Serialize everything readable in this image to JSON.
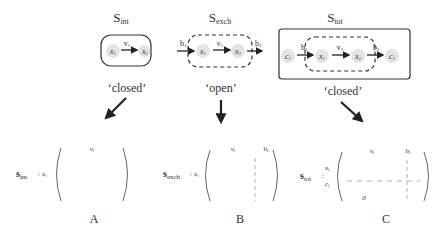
{
  "panels": [
    {
      "id": "A",
      "system_label": "S",
      "system_sub": "int",
      "boundary": "closed",
      "boundary_label": "‘closed’",
      "nodes": [
        "x",
        "x"
      ],
      "node_subs": [
        "1",
        "2"
      ],
      "reaction_label": "v",
      "reaction_sub": "1",
      "matrix_label": "s",
      "matrix_sub": "int",
      "row_labels": [
        "x_i"
      ],
      "col_labels": [
        "v_i"
      ],
      "panel_letter": "A"
    },
    {
      "id": "B",
      "system_label": "S",
      "system_sub": "exch",
      "boundary": "open",
      "boundary_label": "‘open’",
      "exchange_in": "b",
      "exchange_in_sub": "1",
      "exchange_out": "b",
      "exchange_out_sub": "2",
      "nodes": [
        "x",
        "x"
      ],
      "node_subs": [
        "1",
        "2"
      ],
      "reaction_label": "v",
      "reaction_sub": "1",
      "matrix_label": "s",
      "matrix_sub": "exch",
      "row_labels": [
        "x_i"
      ],
      "col_labels": [
        "v_i",
        "b_i"
      ],
      "panel_letter": "B"
    },
    {
      "id": "C",
      "system_label": "S",
      "system_sub": "tot",
      "boundary": "closed",
      "boundary_label": "‘closed’",
      "nodes": [
        "c",
        "x",
        "x",
        "c"
      ],
      "node_subs": [
        "1",
        "1",
        "2",
        "2"
      ],
      "exchange_in": "b",
      "exchange_in_sub": "1",
      "exchange_out": "b",
      "exchange_out_sub": "2",
      "reaction_label": "v",
      "reaction_sub": "1",
      "matrix_label": "s",
      "matrix_sub": "tot",
      "row_labels": [
        "x_i",
        "c_i"
      ],
      "col_labels": [
        "v_i",
        "b_i"
      ],
      "zero_block": "0",
      "panel_letter": "C"
    }
  ]
}
